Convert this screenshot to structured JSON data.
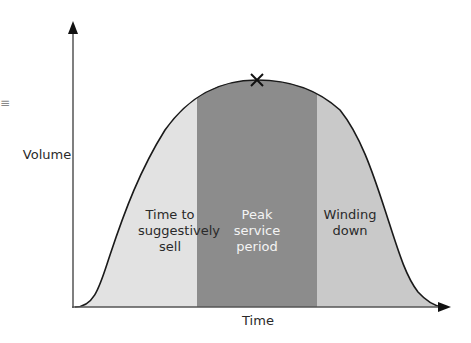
{
  "diagram": {
    "type": "bell-curve-phases",
    "axes": {
      "x_label": "Time",
      "y_label": "Volume"
    },
    "regions": [
      {
        "label_lines": [
          "Time to",
          "suggestively",
          "sell"
        ],
        "color": "#e2e2e2"
      },
      {
        "label_lines": [
          "Peak",
          "service",
          "period"
        ],
        "color": "#8c8c8c"
      },
      {
        "label_lines": [
          "Winding",
          "down"
        ],
        "color": "#c9c9c9"
      }
    ],
    "peak_marker": "x-mark",
    "colors": {
      "axis": "#333333",
      "curve": "#1a1a1a",
      "left_region": "#e2e2e2",
      "peak_region": "#8c8c8c",
      "right_region": "#c9c9c9"
    }
  },
  "side_glyph": "≡"
}
